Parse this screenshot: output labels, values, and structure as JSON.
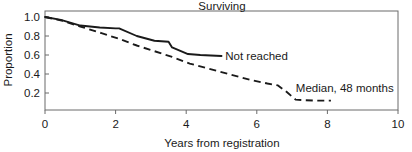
{
  "chart_data": {
    "type": "line",
    "title": "Surviving",
    "xlabel": "Years from registration",
    "ylabel": "Proportion",
    "xlim": [
      0,
      10
    ],
    "ylim": [
      0,
      1.05
    ],
    "xticks": [
      0,
      2,
      4,
      6,
      8,
      10
    ],
    "xticklabels": [
      "0",
      "2",
      "4",
      "6",
      "8",
      "10"
    ],
    "yticks": [
      0.2,
      0.4,
      0.6,
      0.8,
      1.0
    ],
    "yticklabels": [
      "0.2",
      "0.4",
      "0.6",
      "0.8",
      "1.0"
    ],
    "grid": false,
    "legend_position": "inline-annotation",
    "series": [
      {
        "name": "Not reached",
        "style": "solid",
        "color": "#1a1a1a",
        "annotation": "Not reached",
        "points": [
          [
            0.0,
            1.0
          ],
          [
            0.45,
            0.97
          ],
          [
            1.0,
            0.91
          ],
          [
            1.55,
            0.89
          ],
          [
            2.0,
            0.88
          ],
          [
            2.1,
            0.88
          ],
          [
            2.6,
            0.8
          ],
          [
            3.1,
            0.75
          ],
          [
            3.5,
            0.74
          ],
          [
            3.6,
            0.68
          ],
          [
            4.05,
            0.61
          ],
          [
            4.4,
            0.6
          ],
          [
            5.0,
            0.59
          ]
        ]
      },
      {
        "name": "Median, 48 months",
        "style": "dashed",
        "color": "#1a1a1a",
        "annotation": "Median, 48 months",
        "points": [
          [
            0.0,
            1.0
          ],
          [
            0.5,
            0.96
          ],
          [
            1.0,
            0.9
          ],
          [
            1.6,
            0.83
          ],
          [
            2.1,
            0.77
          ],
          [
            2.6,
            0.7
          ],
          [
            3.1,
            0.64
          ],
          [
            3.6,
            0.58
          ],
          [
            4.1,
            0.51
          ],
          [
            4.6,
            0.46
          ],
          [
            5.2,
            0.4
          ],
          [
            5.8,
            0.34
          ],
          [
            6.3,
            0.3
          ],
          [
            6.6,
            0.28
          ],
          [
            6.85,
            0.21
          ],
          [
            7.1,
            0.13
          ],
          [
            7.6,
            0.12
          ],
          [
            8.1,
            0.12
          ]
        ]
      }
    ],
    "annotations": [
      {
        "text": "Not reached",
        "x": 5.05,
        "y": 0.585
      },
      {
        "text": "Median, 48 months",
        "x": 7.05,
        "y": 0.255
      }
    ]
  },
  "axes": {
    "title": "Surviving",
    "x_axis_label": "Years from registration",
    "y_axis_label": "Proportion"
  }
}
